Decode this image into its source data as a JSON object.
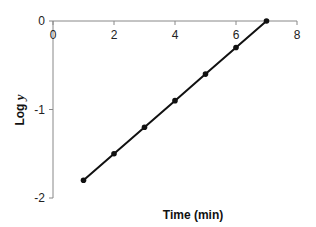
{
  "chart_data": {
    "type": "line",
    "title": "",
    "xlabel": "Time (min)",
    "ylabel": "Log y",
    "ylabel_parts": {
      "main": "Log ",
      "italic": "y"
    },
    "xlim": [
      0,
      8
    ],
    "ylim": [
      -2,
      0
    ],
    "x_ticks": [
      0,
      2,
      4,
      6,
      8
    ],
    "y_ticks": [
      0,
      -1,
      -2
    ],
    "x_tick_labels": [
      "0",
      "2",
      "4",
      "6",
      "8"
    ],
    "y_tick_labels": [
      "0",
      "-1",
      "-2"
    ],
    "grid": false,
    "legend": null,
    "x_axis_position": "top (at y=0)",
    "series": [
      {
        "name": "Log y",
        "x": [
          1,
          2,
          3,
          4,
          5,
          6,
          7
        ],
        "values": [
          -1.8,
          -1.5,
          -1.2,
          -0.9,
          -0.6,
          -0.3,
          0.0
        ],
        "color": "#111111",
        "marker": "circle"
      }
    ]
  }
}
